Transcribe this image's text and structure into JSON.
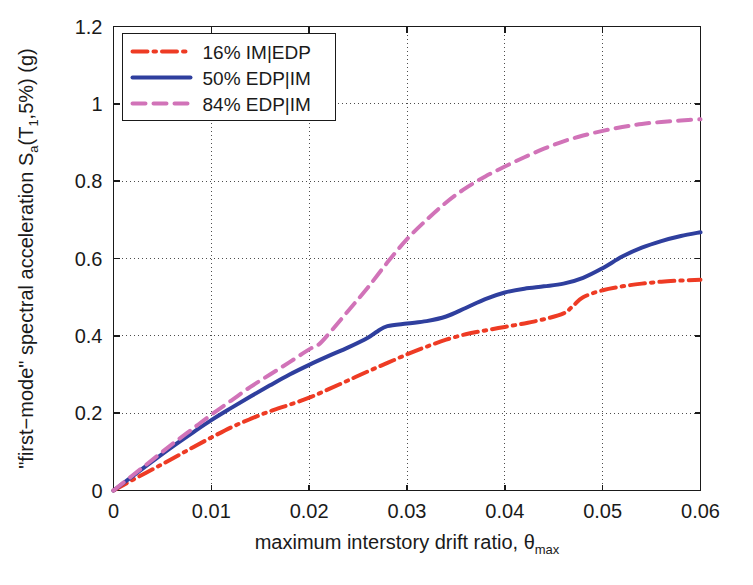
{
  "chart_data": {
    "type": "line",
    "title": "",
    "xlabel": "maximum interstory drift ratio, θmax",
    "xlabel_main": "maximum interstory drift ratio, ",
    "xlabel_symbol": "θ",
    "xlabel_sub": "max",
    "ylabel": "\"first−mode\" spectral acceleration Sa(T1,5%) (g)",
    "ylabel_part1": "\"first−mode\" spectral acceleration S",
    "ylabel_sub1": "a",
    "ylabel_part2": "(T",
    "ylabel_sub2": "1",
    "ylabel_part3": ",5%) (g)",
    "xlim": [
      0,
      0.06
    ],
    "ylim": [
      0,
      1.2
    ],
    "xticks": [
      0,
      0.01,
      0.02,
      0.03,
      0.04,
      0.05,
      0.06
    ],
    "xticklabels": [
      "0",
      "0.01",
      "0.02",
      "0.03",
      "0.04",
      "0.05",
      "0.06"
    ],
    "yticks": [
      0,
      0.2,
      0.4,
      0.6,
      0.8,
      1,
      1.2
    ],
    "yticklabels": [
      "0",
      "0.2",
      "0.4",
      "0.6",
      "0.8",
      "1",
      "1.2"
    ],
    "grid": true,
    "grid_style": "dotted",
    "legend_position": "upper-left",
    "series": [
      {
        "name": "16% IM|EDP",
        "label": "16% IM|EDP",
        "color": "#ee3b24",
        "style": "dash-dot",
        "linewidth": 4,
        "x": [
          0,
          0.002,
          0.004,
          0.006,
          0.008,
          0.01,
          0.012,
          0.014,
          0.016,
          0.018,
          0.02,
          0.022,
          0.024,
          0.026,
          0.028,
          0.03,
          0.032,
          0.034,
          0.036,
          0.038,
          0.04,
          0.042,
          0.044,
          0.046,
          0.047,
          0.048,
          0.05,
          0.052,
          0.054,
          0.056,
          0.058,
          0.06
        ],
        "y": [
          0,
          0.028,
          0.055,
          0.082,
          0.11,
          0.137,
          0.163,
          0.185,
          0.205,
          0.222,
          0.24,
          0.262,
          0.285,
          0.308,
          0.33,
          0.352,
          0.372,
          0.39,
          0.404,
          0.414,
          0.423,
          0.432,
          0.443,
          0.458,
          0.478,
          0.5,
          0.518,
          0.528,
          0.535,
          0.54,
          0.543,
          0.545
        ]
      },
      {
        "name": "50% EDP|IM",
        "label": "50% EDP|IM",
        "color": "#2f3f9e",
        "style": "solid",
        "linewidth": 4,
        "x": [
          0,
          0.002,
          0.004,
          0.006,
          0.008,
          0.01,
          0.012,
          0.014,
          0.016,
          0.018,
          0.02,
          0.022,
          0.024,
          0.026,
          0.027,
          0.028,
          0.03,
          0.032,
          0.034,
          0.036,
          0.038,
          0.04,
          0.042,
          0.044,
          0.046,
          0.048,
          0.05,
          0.052,
          0.054,
          0.056,
          0.058,
          0.06
        ],
        "y": [
          0,
          0.038,
          0.076,
          0.113,
          0.148,
          0.182,
          0.213,
          0.243,
          0.272,
          0.3,
          0.325,
          0.348,
          0.37,
          0.395,
          0.412,
          0.425,
          0.432,
          0.438,
          0.45,
          0.472,
          0.495,
          0.512,
          0.522,
          0.528,
          0.535,
          0.55,
          0.575,
          0.605,
          0.628,
          0.645,
          0.658,
          0.668
        ]
      },
      {
        "name": "84% EDP|IM",
        "label": "84% EDP|IM",
        "color": "#d173b8",
        "style": "dashed",
        "linewidth": 4,
        "x": [
          0,
          0.002,
          0.004,
          0.006,
          0.008,
          0.01,
          0.012,
          0.014,
          0.016,
          0.018,
          0.02,
          0.021,
          0.022,
          0.024,
          0.026,
          0.028,
          0.03,
          0.032,
          0.034,
          0.036,
          0.038,
          0.04,
          0.042,
          0.044,
          0.046,
          0.048,
          0.05,
          0.052,
          0.054,
          0.056,
          0.058,
          0.06
        ],
        "y": [
          0,
          0.04,
          0.08,
          0.12,
          0.158,
          0.196,
          0.232,
          0.268,
          0.3,
          0.332,
          0.365,
          0.378,
          0.405,
          0.465,
          0.525,
          0.59,
          0.65,
          0.7,
          0.745,
          0.782,
          0.812,
          0.838,
          0.862,
          0.884,
          0.903,
          0.918,
          0.93,
          0.94,
          0.948,
          0.953,
          0.957,
          0.96
        ]
      }
    ]
  }
}
